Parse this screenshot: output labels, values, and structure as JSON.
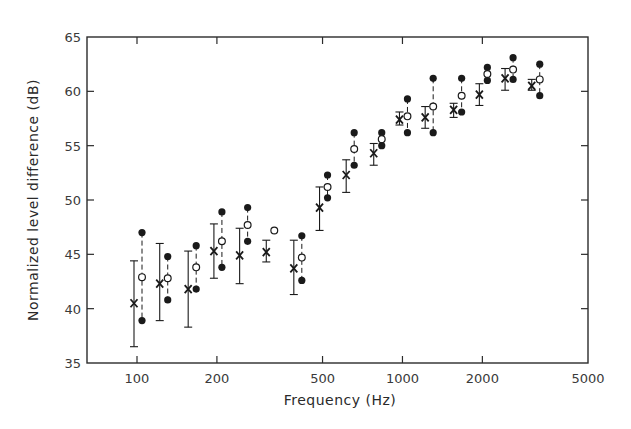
{
  "chart_data": {
    "type": "scatter",
    "title": "",
    "xlabel": "Frequency (Hz)",
    "ylabel": "Normalized level difference (dB)",
    "xscale": "log",
    "xlim": [
      63,
      5000
    ],
    "ylim": [
      35,
      65
    ],
    "grid": false,
    "legend": null,
    "x_ticks": [
      100,
      200,
      500,
      1000,
      2000,
      5000
    ],
    "x_tick_labels": [
      "100",
      "200",
      "500",
      "1000",
      "2000",
      "5000"
    ],
    "y_ticks": [
      35,
      40,
      45,
      50,
      55,
      60,
      65
    ],
    "y_tick_labels": [
      "35",
      "40",
      "45",
      "50",
      "55",
      "60",
      "65"
    ],
    "x": [
      100,
      125,
      160,
      200,
      250,
      315,
      400,
      500,
      630,
      800,
      1000,
      1250,
      1600,
      2000,
      2500,
      3150
    ],
    "series": [
      {
        "name": "mean (x marker) with error bars",
        "marker": "x",
        "values": [
          40.5,
          42.3,
          41.8,
          45.3,
          44.9,
          45.2,
          43.7,
          49.3,
          52.3,
          54.3,
          57.4,
          57.6,
          58.3,
          59.7,
          61.2,
          60.5
        ],
        "err_low": [
          36.5,
          38.9,
          38.3,
          42.8,
          42.3,
          44.3,
          41.3,
          47.2,
          50.7,
          53.2,
          56.9,
          56.6,
          57.6,
          58.7,
          60.1,
          60.1
        ],
        "err_high": [
          44.4,
          46.0,
          45.3,
          47.8,
          47.4,
          46.3,
          46.3,
          51.2,
          53.7,
          55.2,
          58.1,
          58.6,
          58.9,
          60.7,
          62.1,
          61.1
        ]
      },
      {
        "name": "upper (filled circle)",
        "marker": "filled-circle",
        "values": [
          47.0,
          44.8,
          45.8,
          48.9,
          49.3,
          null,
          46.7,
          52.3,
          56.2,
          56.2,
          59.3,
          61.2,
          61.2,
          62.2,
          63.1,
          62.5
        ]
      },
      {
        "name": "open circle",
        "marker": "open-circle",
        "values": [
          42.9,
          42.8,
          43.8,
          46.2,
          47.7,
          47.2,
          44.7,
          51.2,
          54.7,
          55.6,
          57.7,
          58.6,
          59.6,
          61.6,
          62.0,
          61.1
        ]
      },
      {
        "name": "lower (filled circle)",
        "marker": "filled-circle",
        "values": [
          38.9,
          40.8,
          41.8,
          43.8,
          46.2,
          null,
          42.6,
          50.2,
          53.2,
          55.0,
          56.2,
          56.2,
          58.1,
          61.0,
          61.1,
          59.6
        ]
      }
    ]
  },
  "colors": {
    "ink": "#1a1a1a",
    "axis": "#2b2b2b",
    "background": "#ffffff"
  }
}
